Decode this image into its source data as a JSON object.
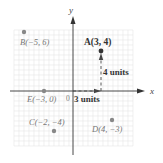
{
  "diagram": {
    "axes": {
      "x_label": "x",
      "y_label": "y",
      "origin_label": "0"
    },
    "points": [
      {
        "id": "A",
        "label": "A(3, 4)",
        "x": 3,
        "y": 4,
        "highlight": true
      },
      {
        "id": "B",
        "label": "B(−5, 6)",
        "x": -5,
        "y": 6,
        "highlight": false
      },
      {
        "id": "C",
        "label": "C(−2, −4)",
        "x": -2,
        "y": -4,
        "highlight": false
      },
      {
        "id": "D",
        "label": "D(4, −3)",
        "x": 4,
        "y": -3,
        "highlight": false
      },
      {
        "id": "E",
        "label": "E(−3, 0)",
        "x": -3,
        "y": 0,
        "highlight": false
      }
    ],
    "annotations": {
      "horizontal": "3 units",
      "vertical": "4 units"
    },
    "colors": {
      "highlight_point": "#333333",
      "other_points": "#888888",
      "grid": "#e3e3e3",
      "axes": "#333333"
    }
  }
}
